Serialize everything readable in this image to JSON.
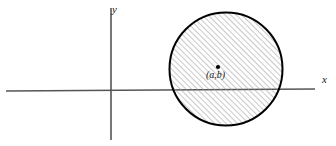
{
  "figure": {
    "background_color": "#ffffff",
    "width": 336,
    "height": 146
  },
  "axes": {
    "x_label": "x",
    "y_label": "y",
    "axis_color": "#555555",
    "x_axis": {
      "x1": 6,
      "y1": 91,
      "x2": 315,
      "y2": 89
    },
    "y_axis": {
      "x1": 111,
      "y1": 8,
      "x2": 111,
      "y2": 140
    },
    "origin": {
      "x": 111,
      "y": 90
    }
  },
  "circle": {
    "center_label": "(a,b)",
    "center_x": 226,
    "center_y": 69,
    "radius": 57,
    "stroke_color": "#000000",
    "stroke_width": 2,
    "fill": "hatch",
    "hatch_color": "#9a9a9a",
    "hatch_spacing": 4,
    "hatch_angle_deg": 45
  },
  "center_marker": {
    "name": "center-point",
    "x": 218,
    "y": 67,
    "color": "#000000",
    "size": 2.2
  }
}
